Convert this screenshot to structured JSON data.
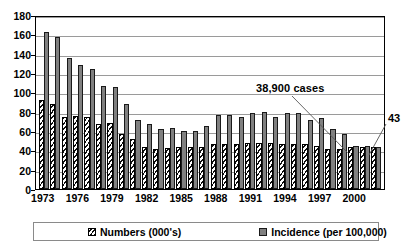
{
  "chart_data": {
    "type": "bar",
    "title": "",
    "subtitle": "",
    "xlabel": "",
    "ylabel": "",
    "ylim": [
      0,
      180
    ],
    "yticks": [
      0,
      20,
      40,
      60,
      80,
      100,
      120,
      140,
      160,
      180
    ],
    "grid": true,
    "legend_position": "bottom",
    "categories": [
      "1973",
      "1974",
      "1975",
      "1976",
      "1977",
      "1978",
      "1979",
      "1980",
      "1981",
      "1982",
      "1983",
      "1984",
      "1985",
      "1986",
      "1987",
      "1988",
      "1989",
      "1990",
      "1991",
      "1992",
      "1993",
      "1994",
      "1995",
      "1996",
      "1997",
      "1998",
      "1999",
      "2000",
      "2001",
      "2002"
    ],
    "xtick_labels": [
      "1973",
      "1976",
      "1979",
      "1982",
      "1985",
      "1988",
      "1991",
      "1994",
      "1997",
      "2000"
    ],
    "xtick_categories": [
      "1973",
      "1976",
      "1979",
      "1982",
      "1985",
      "1988",
      "1991",
      "1994",
      "1997",
      "2000"
    ],
    "series": [
      {
        "name": "Numbers (000's)",
        "pattern": "hatched",
        "color": "#ffffff",
        "values": [
          92,
          88,
          75,
          76,
          74,
          67,
          68,
          57,
          52,
          43,
          41,
          42,
          43,
          43,
          43,
          47,
          47,
          47,
          48,
          48,
          48,
          47,
          47,
          47,
          44,
          41,
          41,
          43,
          43,
          43
        ]
      },
      {
        "name": "Incidence (per 100,000)",
        "pattern": "solid",
        "color": "#808080",
        "values": [
          162,
          157,
          136,
          128,
          124,
          107,
          106,
          88,
          71,
          67,
          62,
          63,
          60,
          60,
          65,
          77,
          77,
          74,
          79,
          80,
          75,
          79,
          79,
          71,
          73,
          62,
          57,
          45,
          45,
          43
        ]
      }
    ],
    "annotations": [
      {
        "id": "cases",
        "text": "38,900 cases",
        "points_to_category": "2000",
        "points_to_series": "Numbers (000's)"
      },
      {
        "id": "last-value",
        "text": "43",
        "points_to_category": "2002",
        "points_to_series": "Incidence (per 100,000)"
      }
    ]
  },
  "legend": {
    "items": [
      {
        "label": "Numbers (000's)",
        "swatch": "hatched-swatch"
      },
      {
        "label": "Incidence (per 100,000)",
        "swatch": "gray-swatch"
      }
    ]
  }
}
